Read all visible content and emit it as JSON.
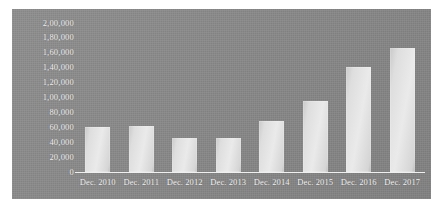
{
  "chart_data": {
    "type": "bar",
    "title": "",
    "subtitle": "",
    "xlabel": "",
    "ylabel": "",
    "categories": [
      "Dec. 2010",
      "Dec. 2011",
      "Dec. 2012",
      "Dec. 2013",
      "Dec. 2014",
      "Dec. 2015",
      "Dec. 2016",
      "Dec. 2017"
    ],
    "values": [
      60000,
      62000,
      46000,
      46000,
      68000,
      95000,
      141000,
      166000
    ],
    "ylim": [
      0,
      200000
    ],
    "y_tick_values": [
      200000,
      180000,
      160000,
      140000,
      120000,
      100000,
      80000,
      60000,
      40000,
      20000,
      0
    ],
    "y_tick_labels": [
      "2,00,000",
      "1,80,000",
      "1,60,000",
      "1,40,000",
      "1,20,000",
      "1,00,000",
      "80,000",
      "60,000",
      "40,000",
      "20,000",
      "0"
    ],
    "grid": false,
    "legend": [],
    "legend_position": "none",
    "number_format": "indian",
    "colors": {
      "background": "#888888",
      "bar": "#e3e3e3",
      "axis": "#f0f0f0",
      "text": "#f4f4f4",
      "page": "#ffffff"
    }
  }
}
